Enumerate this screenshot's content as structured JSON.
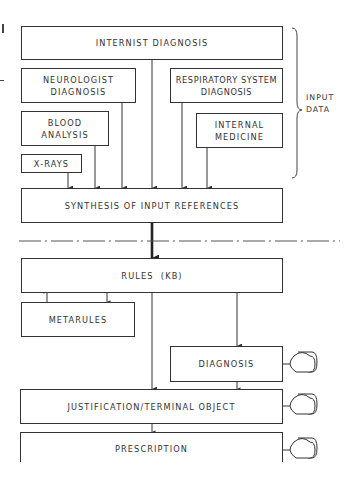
{
  "diagram": {
    "type": "flowchart",
    "colors": {
      "line": "#333333",
      "background": "#ffffff",
      "text": "#333333"
    },
    "input_section": {
      "brace_label_line1": "INPUT",
      "brace_label_line2": "DATA",
      "boxes": {
        "internist": "INTERNIST DIAGNOSIS",
        "neurologist_line1": "NEUROLOGIST",
        "neurologist_line2": "DIAGNOSIS",
        "respiratory_line1": "RESPIRATORY SYSTEM",
        "respiratory_line2": "DIAGNOSIS",
        "blood_line1": "BLOOD",
        "blood_line2": "ANALYSIS",
        "internal_line1": "INTERNAL",
        "internal_line2": "MEDICINE",
        "xrays": "X-RAYS"
      }
    },
    "synthesis": "SYNTHESIS OF INPUT REFERENCES",
    "knowledge_section": {
      "rules": "RULES  (KB)",
      "metarules": "METARULES",
      "diagnosis": "DIAGNOSIS",
      "justification": "JUSTIFICATION/TERMINAL OBJECT",
      "prescription": "PRESCRIPTION"
    },
    "output_devices": [
      {
        "name": "terminal-diagnosis",
        "icon": "display-terminal-icon"
      },
      {
        "name": "terminal-justification",
        "icon": "display-terminal-icon"
      },
      {
        "name": "terminal-prescription",
        "icon": "display-terminal-icon"
      }
    ],
    "separator": "dash-dot line"
  }
}
